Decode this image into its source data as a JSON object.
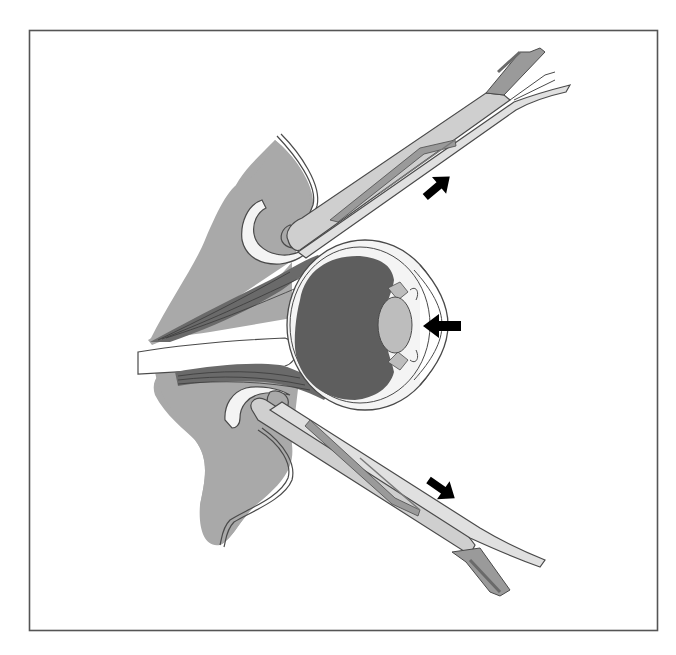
{
  "figure": {
    "colors": {
      "background": "#ffffff",
      "frame": "#555555",
      "soft_tissue": "#a9a9a9",
      "tissue_outline": "#4a4a4a",
      "vitreous": "#5e5e5e",
      "lens": "#bdbdbd",
      "sclera": "#f4f4f4",
      "muscle": "#6a6a6a",
      "instrument": "#cfcfcf",
      "instrument_dark": "#7a7a7a",
      "arrow": "#000000"
    },
    "elements": [
      {
        "id": "globe",
        "label": "Eyeball (globe)"
      },
      {
        "id": "vitreous",
        "label": "Vitreous body"
      },
      {
        "id": "lens",
        "label": "Lens"
      },
      {
        "id": "cornea",
        "label": "Cornea"
      },
      {
        "id": "upper-eyelid",
        "label": "Upper eyelid"
      },
      {
        "id": "lower-eyelid",
        "label": "Lower eyelid"
      },
      {
        "id": "extraocular-muscles",
        "label": "Extraocular muscles"
      },
      {
        "id": "optic-nerve",
        "label": "Optic nerve"
      },
      {
        "id": "upper-forceps",
        "label": "Upper forceps"
      },
      {
        "id": "lower-forceps",
        "label": "Lower forceps"
      }
    ],
    "arrows": [
      {
        "id": "arrow-upper",
        "direction": "up-right",
        "meaning": "Upper lid traction"
      },
      {
        "id": "arrow-middle",
        "direction": "left",
        "meaning": "Pressure on globe"
      },
      {
        "id": "arrow-lower",
        "direction": "down-right",
        "meaning": "Lower lid traction"
      }
    ]
  }
}
